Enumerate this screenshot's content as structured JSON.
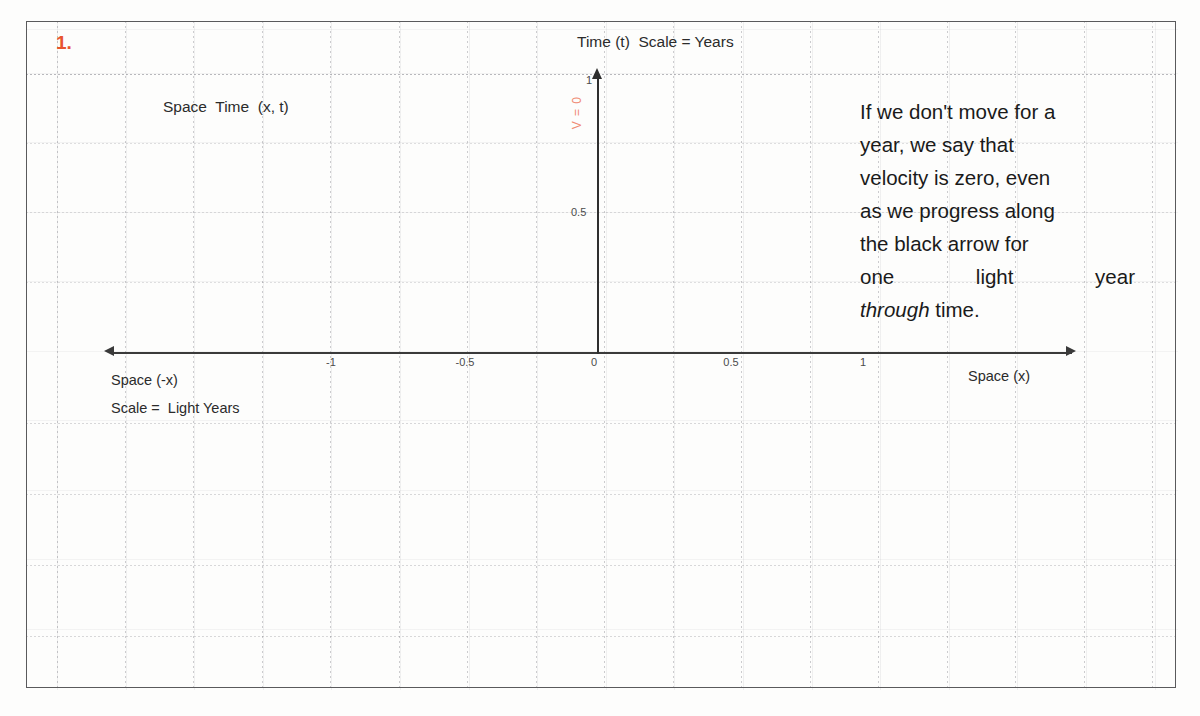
{
  "page": {
    "item_number": "1.",
    "accent_color": "#e8542e",
    "annotation_color": "#f08a72",
    "axis_color": "#3a3a3a"
  },
  "diagram": {
    "title": "Time (t)  Scale = Years",
    "inner_label": "Space  Time  (x, t)",
    "velocity_annotation": "V = 0",
    "x_axis": {
      "negative_caption": "Space (-x)",
      "scale_caption": "Scale =  Light Years",
      "positive_caption": "Space (x)",
      "ticks": [
        {
          "label": "-1",
          "value": -1,
          "x": 331
        },
        {
          "label": "-0.5",
          "value": -0.5,
          "x": 465
        },
        {
          "label": "0",
          "value": 0,
          "x": 597
        },
        {
          "label": "0.5",
          "value": 0.5,
          "x": 729
        },
        {
          "label": "1",
          "value": 1,
          "x": 862
        }
      ]
    },
    "t_axis": {
      "ticks": [
        {
          "label": "0.5",
          "value": 0.5,
          "y": 212
        },
        {
          "label": "1",
          "value": 1,
          "y": 80
        }
      ]
    }
  },
  "chart_data": {
    "type": "line",
    "title": "Time (t)  Scale = Years",
    "xlabel": "Space (x) — Scale = Light Years",
    "ylabel": "Time (t) — Scale = Years",
    "xlim": [
      -1.25,
      1.25
    ],
    "ylim": [
      0,
      1.05
    ],
    "xticks": [
      -1,
      -0.5,
      0,
      0.5,
      1
    ],
    "xticklabels": [
      "-1",
      "-0.5",
      "0",
      "0.5",
      "1"
    ],
    "yticks": [
      0.5,
      1
    ],
    "yticklabels": [
      "0.5",
      "1"
    ],
    "grid": true,
    "legend": "none",
    "series": [
      {
        "name": "worldline of stationary observer (V = 0)",
        "color": "#2e2e2e",
        "arrow": "up",
        "x": [
          0,
          0
        ],
        "y": [
          0,
          1
        ]
      }
    ],
    "annotations": [
      {
        "text": "V = 0",
        "x": -0.02,
        "y": 0.82,
        "rotation": 90,
        "color": "#f08a72"
      },
      {
        "text": "Space  Time  (x, t)",
        "x": -0.77,
        "y": 0.92,
        "color": "#2b2b2b"
      }
    ]
  },
  "explanation": {
    "lines": [
      "If we don't move for a",
      "year, we say that",
      "velocity is zero, even",
      "as we progress along",
      "the black arrow for",
      "one light year"
    ],
    "emphasis_word": "through",
    "tail": " time.",
    "full_text": "If we don't move for a year, we say that velocity is zero, even as we progress along the black arrow for one light year through time."
  }
}
